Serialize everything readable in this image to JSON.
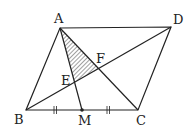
{
  "diagram": {
    "type": "geometry",
    "points": {
      "A": {
        "x": 60,
        "y": 28
      },
      "B": {
        "x": 26,
        "y": 110
      },
      "C": {
        "x": 138,
        "y": 110
      },
      "D": {
        "x": 171,
        "y": 27
      },
      "M": {
        "x": 82,
        "y": 110
      },
      "E": {
        "x": 74,
        "y": 82
      },
      "F": {
        "x": 99,
        "y": 69
      }
    },
    "labels": {
      "A": "A",
      "B": "B",
      "C": "C",
      "D": "D",
      "M": "M",
      "E": "E",
      "F": "F"
    },
    "segments": [
      "AB",
      "BC",
      "CD",
      "DA",
      "AC",
      "BD",
      "AM"
    ],
    "shaded_region": [
      "A",
      "E",
      "F"
    ],
    "equal_marks": [
      "BM",
      "MC"
    ],
    "colors": {
      "line": "#222222",
      "hatch": "#444444",
      "background": "#ffffff"
    }
  }
}
